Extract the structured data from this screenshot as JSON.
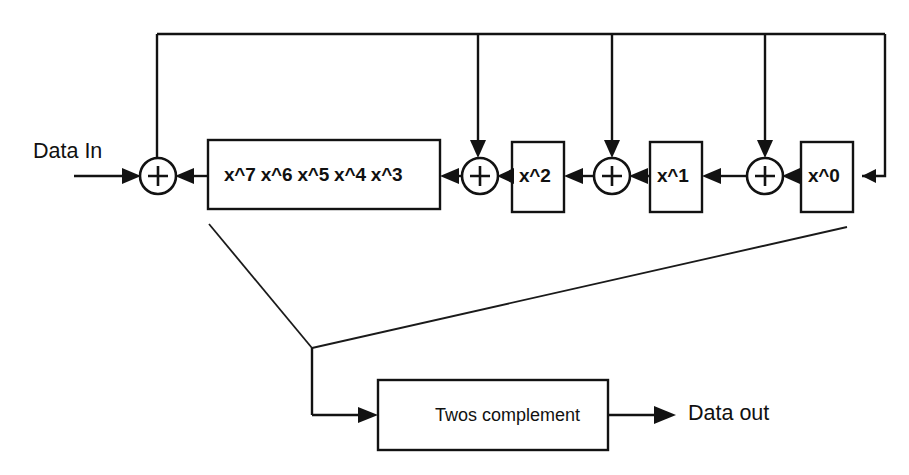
{
  "diagram": {
    "colors": {
      "line": "#121212",
      "background": "#ffffff",
      "text": "#111111"
    },
    "io": {
      "data_in_label": "Data In",
      "data_out_label": "Data out"
    },
    "shift_register": {
      "main_box_label": "x^7   x^6   x^5   x^4   x^3",
      "taps": [
        "x^7",
        "x^6",
        "x^5",
        "x^4",
        "x^3"
      ],
      "stage_boxes": [
        {
          "label": "x^2"
        },
        {
          "label": "x^1"
        },
        {
          "label": "x^0"
        }
      ]
    },
    "adders": [
      {
        "symbol": "+",
        "name": "adder-input"
      },
      {
        "symbol": "+",
        "name": "adder-x2"
      },
      {
        "symbol": "+",
        "name": "adder-x1"
      },
      {
        "symbol": "+",
        "name": "adder-x0"
      }
    ],
    "output_block": {
      "label": "Twos complement"
    }
  }
}
